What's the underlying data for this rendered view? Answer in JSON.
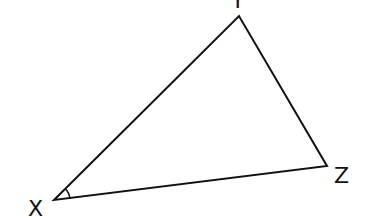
{
  "diagram": {
    "type": "triangle",
    "vertices": [
      {
        "name": "X",
        "label": "X",
        "x": 54,
        "y": 200,
        "label_x": 28,
        "label_y": 216
      },
      {
        "name": "Y",
        "label": "Y",
        "x": 239,
        "y": 16,
        "label_x": 231,
        "label_y": 8
      },
      {
        "name": "Z",
        "label": "Z",
        "x": 327,
        "y": 166,
        "label_x": 334,
        "label_y": 183
      }
    ],
    "angle_marker": {
      "vertex": "X",
      "radius": 16
    },
    "stroke_color": "#111111"
  }
}
